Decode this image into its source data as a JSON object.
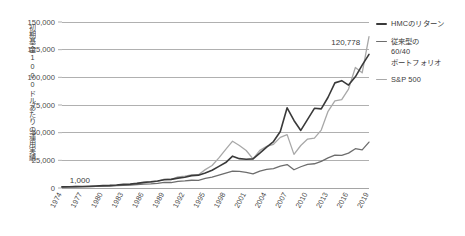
{
  "chart_data": {
    "type": "line",
    "title": "",
    "subtitle": "",
    "xlabel": "",
    "ylabel": "初期基金1000ドルあたりの運用実績",
    "xlim": [
      1974,
      2019
    ],
    "ylim": [
      0,
      150000
    ],
    "grid": true,
    "legend_position": "right",
    "y_ticks": [
      "0",
      "25,000",
      "50,000",
      "75,000",
      "100,000",
      "125,000",
      "150,000"
    ],
    "y_tick_values": [
      0,
      25000,
      50000,
      75000,
      100000,
      125000,
      150000
    ],
    "x_ticks": [
      "1974",
      "1977",
      "1980",
      "1983",
      "1986",
      "1989",
      "1992",
      "1995",
      "1998",
      "2001",
      "2004",
      "2007",
      "2010",
      "2013",
      "2016",
      "2019"
    ],
    "x_tick_values": [
      1974,
      1977,
      1980,
      1983,
      1986,
      1989,
      1992,
      1995,
      1998,
      2001,
      2004,
      2007,
      2010,
      2013,
      2016,
      2019
    ],
    "annotations": [
      {
        "text": "1,000",
        "x": 1975,
        "y": 1000
      },
      {
        "text": "120,778",
        "x": 2018,
        "y": 120778
      }
    ],
    "x": [
      1974,
      1975,
      1976,
      1977,
      1978,
      1979,
      1980,
      1981,
      1982,
      1983,
      1984,
      1985,
      1986,
      1987,
      1988,
      1989,
      1990,
      1991,
      1992,
      1993,
      1994,
      1995,
      1996,
      1997,
      1998,
      1999,
      2000,
      2001,
      2002,
      2003,
      2004,
      2005,
      2006,
      2007,
      2008,
      2009,
      2010,
      2011,
      2012,
      2013,
      2014,
      2015,
      2016,
      2017,
      2018,
      2019
    ],
    "series": [
      {
        "name": "HMCのリターン",
        "color": "#3a3a3a",
        "width": 1.6,
        "values": [
          1000,
          1080,
          1260,
          1380,
          1560,
          1820,
          2150,
          2330,
          2720,
          3280,
          3500,
          4200,
          5050,
          5600,
          6350,
          7500,
          7800,
          8900,
          9700,
          11200,
          11600,
          13600,
          16000,
          19500,
          23000,
          28800,
          26500,
          26000,
          26300,
          31500,
          37000,
          42000,
          51000,
          72500,
          61000,
          52000,
          62000,
          72000,
          71500,
          82000,
          95000,
          97000,
          93000,
          100500,
          111000,
          120778
        ]
      },
      {
        "name": "従来型の 60/40 ポートフォリオ",
        "color": "#6d6d6d",
        "width": 1.3,
        "values": [
          1000,
          1060,
          1230,
          1240,
          1300,
          1450,
          1720,
          1760,
          2080,
          2380,
          2530,
          3070,
          3570,
          3700,
          4170,
          5010,
          4950,
          5950,
          6350,
          7000,
          6900,
          8600,
          9800,
          11600,
          13400,
          15200,
          15000,
          14100,
          12800,
          15200,
          16800,
          17600,
          19800,
          21200,
          16500,
          19200,
          21300,
          21900,
          24000,
          27200,
          29700,
          29500,
          31500,
          35500,
          34500,
          41500
        ]
      },
      {
        "name": "S&P 500",
        "color": "#a8a8a8",
        "width": 1.3,
        "values": [
          1000,
          1090,
          1350,
          1250,
          1330,
          1580,
          2090,
          1990,
          2420,
          2960,
          3150,
          4150,
          4920,
          5180,
          6040,
          7950,
          7700,
          10050,
          10810,
          11900,
          12060,
          16590,
          20390,
          27190,
          34960,
          42300,
          38450,
          33880,
          26390,
          33950,
          37640,
          39480,
          45720,
          48220,
          30380,
          38420,
          44210,
          45140,
          52350,
          69300,
          78770,
          79880,
          89400,
          108900,
          104100,
          136700
        ]
      }
    ]
  },
  "legend": {
    "items": [
      {
        "lines": [
          "HMCのリターン"
        ]
      },
      {
        "lines": [
          "従来型の",
          "60/40",
          "ポートフォリオ"
        ]
      },
      {
        "lines": [
          "S&P 500"
        ]
      }
    ]
  },
  "colors": {
    "hmc": "#3a3a3a",
    "sixty_forty": "#6d6d6d",
    "sp500": "#a8a8a8",
    "grid": "#8e8e8e",
    "text": "#3b3b3b",
    "background": "#ffffff"
  }
}
